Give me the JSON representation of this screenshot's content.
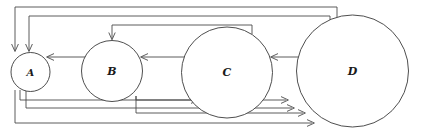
{
  "figure": {
    "name": "directed-graph-four-nodes",
    "background_color": "#ffffff",
    "stroke_color": "#4a4a4a",
    "node_stroke_color": "#3a3a3a",
    "label_color": "#1a1a1a",
    "width": 421,
    "height": 134
  },
  "nodes": [
    {
      "id": "A",
      "label": "A",
      "cx": 30.5,
      "cy": 72.0,
      "r": 19.5,
      "font_size": 10
    },
    {
      "id": "B",
      "label": "B",
      "cx": 112.0,
      "cy": 71.0,
      "r": 30.5,
      "font_size": 11
    },
    {
      "id": "C",
      "label": "C",
      "cx": 227.0,
      "cy": 72.5,
      "r": 45.5,
      "font_size": 11
    },
    {
      "id": "D",
      "label": "D",
      "cx": 352.5,
      "cy": 71.0,
      "r": 56.0,
      "font_size": 11
    }
  ],
  "edges": [
    {
      "id": "e-d-a-outer",
      "from": "D",
      "to": "A",
      "routing": "top-outer",
      "level_y": 7,
      "label": ""
    },
    {
      "id": "e-d-a-inner",
      "from": "D",
      "to": "A",
      "routing": "top-middle",
      "level_y": 16,
      "label": ""
    },
    {
      "id": "e-c-b-top",
      "from": "C",
      "to": "B",
      "routing": "top-inner",
      "level_y": 25,
      "label": ""
    },
    {
      "id": "e-b-a",
      "from": "B",
      "to": "A",
      "routing": "direct",
      "level_y": 57,
      "label": ""
    },
    {
      "id": "e-c-b-mid",
      "from": "C",
      "to": "B",
      "routing": "direct",
      "level_y": 57,
      "label": ""
    },
    {
      "id": "e-d-c",
      "from": "D",
      "to": "C",
      "routing": "direct",
      "level_y": 57,
      "label": ""
    },
    {
      "id": "e-a-c",
      "from": "A",
      "to": "C",
      "routing": "bottom-1",
      "level_y": 100,
      "label": ""
    },
    {
      "id": "e-a-d-1",
      "from": "A",
      "to": "D",
      "routing": "bottom-2",
      "level_y": 108,
      "label": ""
    },
    {
      "id": "e-b-d-1",
      "from": "B",
      "to": "D",
      "routing": "bottom-2b",
      "level_y": 100,
      "label": ""
    },
    {
      "id": "e-b-d-2",
      "from": "B",
      "to": "D",
      "routing": "bottom-3",
      "level_y": 113,
      "label": ""
    },
    {
      "id": "e-a-d-2",
      "from": "A",
      "to": "D",
      "routing": "bottom-4",
      "level_y": 123,
      "label": ""
    }
  ],
  "legend": {
    "caption": ""
  }
}
